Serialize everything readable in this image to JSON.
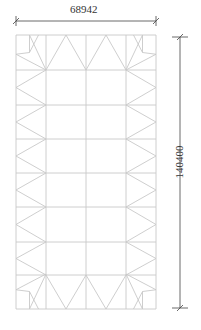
{
  "drawing": {
    "type": "structural-truss-plan",
    "width_label": "68942",
    "height_label": "140400",
    "grid": {
      "columns": 4,
      "rows": 8
    },
    "line_color": "#c8c8c8",
    "dim_color": "#444444"
  }
}
